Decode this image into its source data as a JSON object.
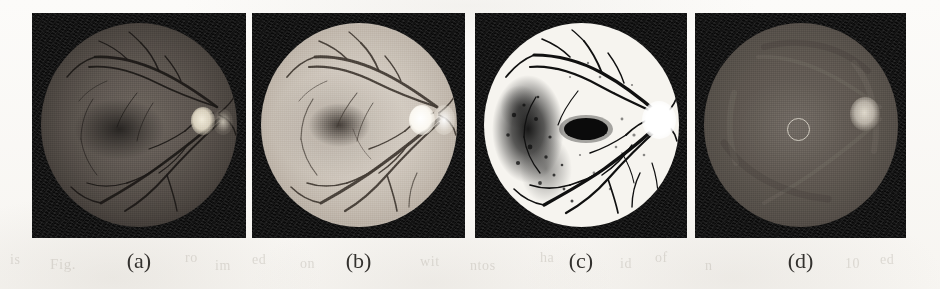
{
  "figure": {
    "panel_count": 4,
    "background_color": "#fbfaf8",
    "caption_color": "#33312e"
  },
  "panels": [
    {
      "id": "panel-a",
      "caption": "(a)",
      "content_name": "retinal-fundus-original",
      "description": "Original dark grayscale retinal fundus photograph with vessel tree and bright optic disc at right",
      "frame_color": "#121212",
      "retina_color": "#5b544e",
      "vessel_color": "#1d1a18",
      "optic_disc_color": "#e8e2d6",
      "x": 32,
      "y": 13,
      "width": 214,
      "height": 225
    },
    {
      "id": "panel-b",
      "caption": "(b)",
      "content_name": "retinal-fundus-contrast-enhanced",
      "description": "Contrast-enhanced retinal fundus: bright retina surface with dark vessel tree and luminous rim",
      "frame_color": "#141414",
      "retina_color": "#cfc7bd",
      "vessel_color": "#3a342e",
      "optic_disc_color": "#ffffff",
      "x": 252,
      "y": 13,
      "width": 213,
      "height": 225
    },
    {
      "id": "panel-c",
      "caption": "(c)",
      "content_name": "retinal-fundus-binarized-vessel-map",
      "description": "Binarized / thresholded image: black vessel segmentation and dark lesion cluster on a white retinal field",
      "frame_color": "#121212",
      "retina_color": "#f6f4ef",
      "vessel_color": "#111111",
      "optic_disc_color": "#ffffff",
      "x": 475,
      "y": 13,
      "width": 212,
      "height": 225
    },
    {
      "id": "panel-d",
      "caption": "(d)",
      "content_name": "retinal-fundus-smoothed-background",
      "description": "Smoothed background-estimate image with vessels removed; circular marker annotates the fovea and a bright optic disc sits at right",
      "frame_color": "#121212",
      "retina_color": "#5e5750",
      "vessel_color": "none",
      "optic_disc_color": "#cfc8bd",
      "marker": "fovea-circle-annotation",
      "x": 695,
      "y": 13,
      "width": 211,
      "height": 225
    }
  ],
  "bleed_through_text": [
    {
      "text": "is",
      "x": 10,
      "y": 252,
      "size": 14
    },
    {
      "text": "Fig.",
      "x": 50,
      "y": 256,
      "size": 15
    },
    {
      "text": "ro",
      "x": 185,
      "y": 250,
      "size": 14
    },
    {
      "text": "im",
      "x": 215,
      "y": 258,
      "size": 14
    },
    {
      "text": "ed",
      "x": 252,
      "y": 252,
      "size": 14
    },
    {
      "text": "on",
      "x": 300,
      "y": 256,
      "size": 14
    },
    {
      "text": "wit",
      "x": 420,
      "y": 254,
      "size": 14
    },
    {
      "text": "ntos",
      "x": 470,
      "y": 258,
      "size": 14
    },
    {
      "text": "ha",
      "x": 540,
      "y": 250,
      "size": 14
    },
    {
      "text": "id",
      "x": 620,
      "y": 256,
      "size": 14
    },
    {
      "text": "of",
      "x": 655,
      "y": 250,
      "size": 14
    },
    {
      "text": "n",
      "x": 705,
      "y": 258,
      "size": 14
    },
    {
      "text": "10",
      "x": 845,
      "y": 256,
      "size": 14
    },
    {
      "text": "ed",
      "x": 880,
      "y": 252,
      "size": 14
    }
  ]
}
